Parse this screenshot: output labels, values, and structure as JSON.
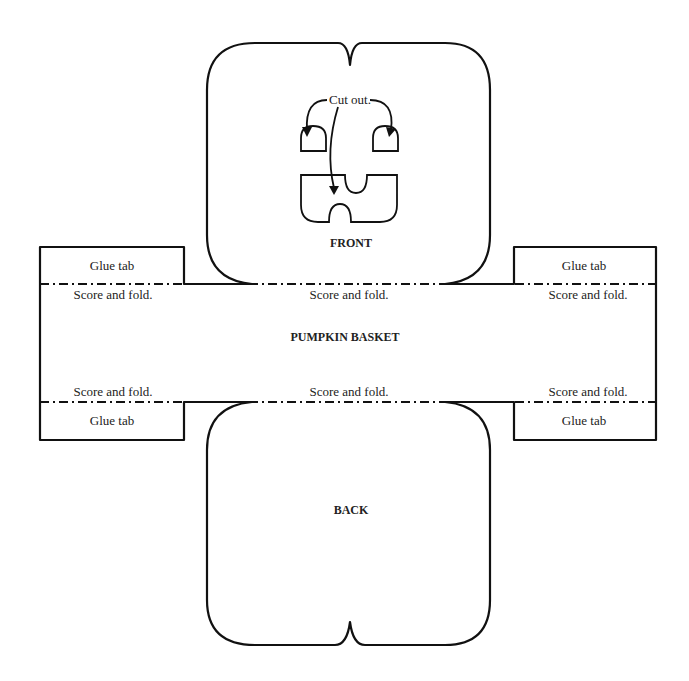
{
  "title": "PUMPKIN BASKET",
  "pieces": {
    "front": {
      "label": "FRONT"
    },
    "back": {
      "label": "BACK"
    }
  },
  "annotations": {
    "cut_out": "Cut out."
  },
  "fold_labels": {
    "top_left": "Score and fold.",
    "top_center": "Score and fold.",
    "top_right": "Score and fold.",
    "bottom_left": "Score and fold.",
    "bottom_center": "Score and fold.",
    "bottom_right": "Score and fold."
  },
  "glue_tabs": {
    "top_left": "Glue tab",
    "top_right": "Glue tab",
    "bottom_left": "Glue tab",
    "bottom_right": "Glue tab"
  },
  "colors": {
    "line": "#111111",
    "background": "#ffffff"
  }
}
